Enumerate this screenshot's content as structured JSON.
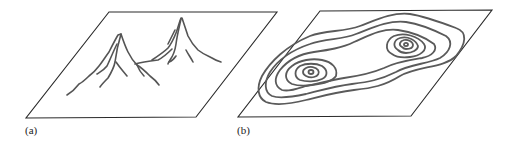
{
  "figure": {
    "panels": [
      {
        "id": "a",
        "label": "(a)",
        "description": "Mountain terrain sketch with two peaks on a flat plane"
      },
      {
        "id": "b",
        "label": "(b)",
        "description": "Contour map of the same two-peak terrain"
      }
    ],
    "contour_levels": 7,
    "colors": {
      "line": "#555555",
      "frame": "#2a2a2a",
      "background": "#ffffff"
    }
  }
}
